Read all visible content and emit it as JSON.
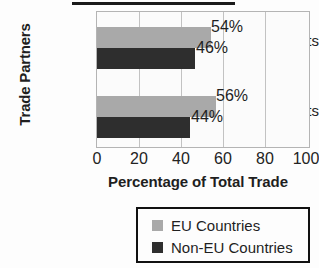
{
  "chart_data": {
    "type": "bar",
    "orientation": "horizontal",
    "title": "",
    "xlabel": "Percentage of Total Trade",
    "ylabel": "Trade Partners",
    "categories": [
      "Exports",
      "Imports"
    ],
    "xlim": [
      0,
      100
    ],
    "xticks": [
      "0",
      "20",
      "40",
      "60",
      "80",
      "100"
    ],
    "grid": true,
    "legend_position": "bottom",
    "series": [
      {
        "name": "EU Countries",
        "color": "#a9a9a9",
        "values": [
          54,
          56
        ],
        "labels": [
          "54%",
          "56%"
        ]
      },
      {
        "name": "Non-EU Countries",
        "color": "#2e2e2e",
        "values": [
          46,
          44
        ],
        "labels": [
          "46%",
          "44%"
        ]
      }
    ]
  },
  "axis": {
    "y_title": "Trade Partners",
    "x_title": "Percentage of Total Trade",
    "categories": {
      "exports": "Exports",
      "imports": "Imports"
    },
    "ticks": {
      "t0": "0",
      "t1": "20",
      "t2": "40",
      "t3": "60",
      "t4": "80",
      "t5": "100"
    }
  },
  "values": {
    "exports_eu": "54%",
    "exports_noneu": "46%",
    "imports_eu": "56%",
    "imports_noneu": "44%"
  },
  "legend": {
    "items": [
      {
        "label": "EU Countries",
        "color": "#a9a9a9"
      },
      {
        "label": "Non-EU Countries",
        "color": "#2e2e2e"
      }
    ]
  },
  "colors": {
    "eu": "#a9a9a9",
    "non_eu": "#2e2e2e",
    "grid": "#c2c2c2",
    "plot_border": "#b4b4b4",
    "text": "#1f1f1f"
  }
}
